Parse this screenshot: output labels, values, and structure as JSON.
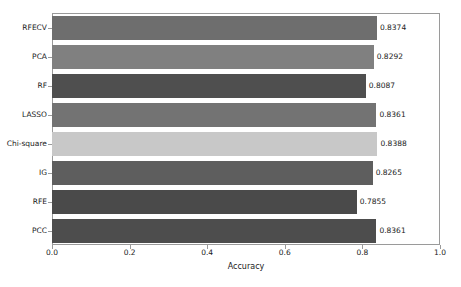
{
  "chart_data": {
    "type": "bar",
    "orientation": "horizontal",
    "title": "",
    "xlabel": "Accuracy",
    "ylabel": "",
    "categories": [
      "RFECV",
      "PCA",
      "RF",
      "LASSO",
      "Chi-square",
      "IG",
      "RFE",
      "PCC"
    ],
    "values": [
      0.8374,
      0.8292,
      0.8087,
      0.8361,
      0.8388,
      0.8265,
      0.7855,
      0.8361
    ],
    "value_labels": [
      "0.8374",
      "0.8292",
      "0.8087",
      "0.8361",
      "0.8388",
      "0.8265",
      "0.7855",
      "0.8361"
    ],
    "bar_colors": [
      "#6e6e6e",
      "#808080",
      "#4f4f4f",
      "#737373",
      "#c8c8c8",
      "#5e5e5e",
      "#4a4a4a",
      "#4d4d4d"
    ],
    "xlim": [
      0.0,
      1.0
    ],
    "ylim_categories_order": "top-to-bottom",
    "xticks": [
      0.0,
      0.2,
      0.4,
      0.6,
      0.8,
      1.0
    ],
    "xtick_labels": [
      "0.0",
      "0.2",
      "0.4",
      "0.6",
      "0.8",
      "1.0"
    ],
    "grid": false,
    "legend": null,
    "legend_position": "none"
  }
}
